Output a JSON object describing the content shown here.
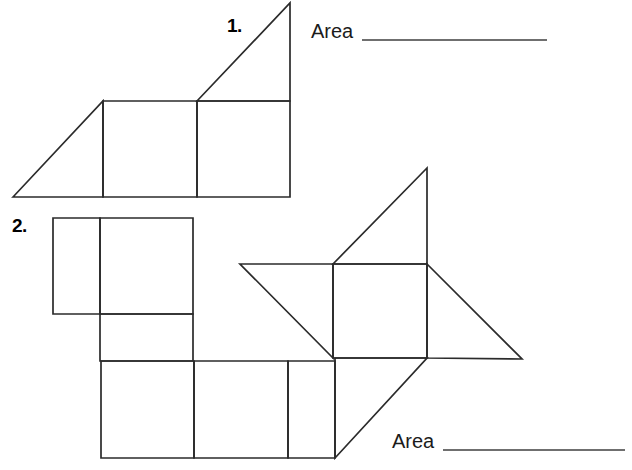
{
  "page": {
    "background_color": "#ffffff",
    "line_color": "#2b2b2b",
    "rule_color": "#6f6f6f",
    "width": 632,
    "height": 470
  },
  "problems": [
    {
      "number_label": "1.",
      "area_label": "Area",
      "answer_value": "",
      "figure_name": "composite-figure-triangle-and-two-squares"
    },
    {
      "number_label": "2.",
      "area_label": "Area",
      "answer_value": "",
      "figure_name": "composite-figure-squares-and-triangles"
    }
  ],
  "figure_1": {
    "description": "Right triangle on the left, two adjacent squares, and a right triangle rising above the right square",
    "shapes": [
      {
        "name": "left-triangle",
        "type": "polygon",
        "points": "13,197 103,101 103,197"
      },
      {
        "name": "left-square",
        "type": "rect",
        "points": "103,101 197,101 197,197 103,197"
      },
      {
        "name": "right-square",
        "type": "rect",
        "points": "197,101 290,101 290,197 197,197"
      },
      {
        "name": "top-triangle",
        "type": "polygon",
        "points": "197,101 290,3 290,101"
      }
    ]
  },
  "figure_2": {
    "description": "Arrangement of squares with triangles forming a pinwheel-like composite figure",
    "shapes": [
      {
        "name": "upper-left-small-square",
        "type": "rect",
        "points": "53,218 100,218 100,314 53,314"
      },
      {
        "name": "upper-right-square",
        "type": "rect",
        "points": "100,218 193,218 193,314 100,314"
      },
      {
        "name": "middle-rectangle",
        "type": "rect",
        "points": "100,314 193,314 193,361 100,361"
      },
      {
        "name": "bottom-square-1",
        "type": "rect",
        "points": "101,361 194,361 194,458 101,458"
      },
      {
        "name": "bottom-square-2",
        "type": "rect",
        "points": "194,361 288,361 288,458 194,458"
      },
      {
        "name": "bottom-rectangle-3",
        "type": "rect",
        "points": "288,361 335,361 335,458 288,458"
      },
      {
        "name": "center-square",
        "type": "rect",
        "points": "333,264 427,264 427,358 333,358"
      },
      {
        "name": "upper-triangle",
        "type": "polygon",
        "points": "333,264 427,168 427,264"
      },
      {
        "name": "left-triangle",
        "type": "polygon",
        "points": "240,264 333,264 333,358"
      },
      {
        "name": "right-triangle",
        "type": "polygon",
        "points": "427,264 522,359 427,358"
      },
      {
        "name": "lower-triangle",
        "type": "polygon",
        "points": "335,458 427,358 335,358"
      }
    ]
  }
}
